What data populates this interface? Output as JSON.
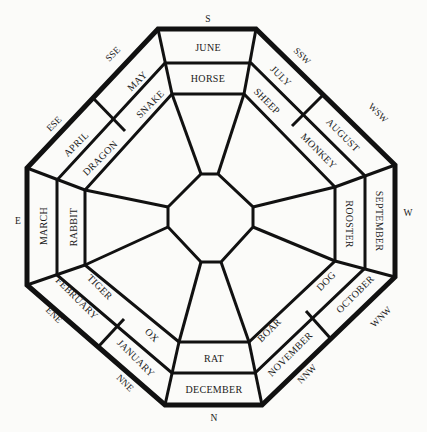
{
  "directions": {
    "S": "S",
    "SSW": "SSW",
    "WSW": "WSW",
    "W": "W",
    "WNW": "WNW",
    "NNW": "NNW",
    "N": "N",
    "NNE": "NNE",
    "ENE": "ENE",
    "E": "E",
    "ESE": "ESE",
    "SSE": "SSE"
  },
  "months": {
    "june": "JUNE",
    "july": "JULY",
    "august": "AUGUST",
    "september": "SEPTEMBER",
    "october": "OCTOBER",
    "november": "NOVEMBER",
    "december": "DECEMBER",
    "january": "JANUARY",
    "february": "FEBRUARY",
    "march": "MARCH",
    "april": "APRIL",
    "may": "MAY"
  },
  "animals": {
    "horse": "HORSE",
    "sheep": "SHEEP",
    "monkey": "MONKEY",
    "rooster": "ROOSTER",
    "dog": "DOG",
    "boar": "BOAR",
    "rat": "RAT",
    "ox": "OX",
    "tiger": "TIGER",
    "rabbit": "RABBIT",
    "dragon": "DRAGON",
    "snake": "SNAKE"
  },
  "colors": {
    "ink": "#111111",
    "paper": "#fbfbf9"
  }
}
